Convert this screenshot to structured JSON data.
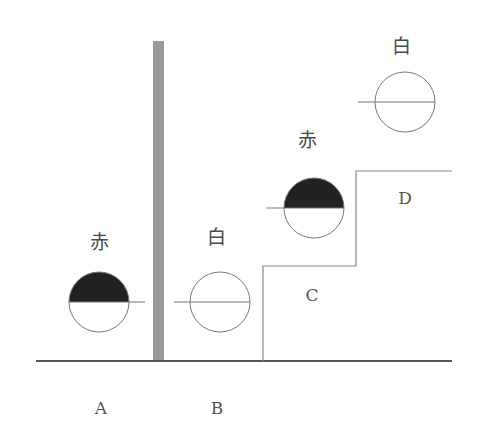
{
  "diagram": {
    "type": "flag-signal-step-diagram",
    "colors": {
      "background": "#ffffff",
      "line": "#777777",
      "ground": "#555555",
      "pole": "#9a9a9a",
      "red_fill": "#222222"
    },
    "flags": [
      {
        "id": "A",
        "label": "赤",
        "meaning": "red",
        "cx": 99,
        "cy": 302,
        "filled_top": true,
        "line_x1": 69,
        "line_x2": 145,
        "label_x": 99,
        "label_y": 240
      },
      {
        "id": "B",
        "label": "白",
        "meaning": "white",
        "cx": 220,
        "cy": 302,
        "filled_top": false,
        "line_x1": 174,
        "line_x2": 250,
        "label_x": 216,
        "label_y": 235
      },
      {
        "id": "C",
        "label": "赤",
        "meaning": "red",
        "cx": 314,
        "cy": 208,
        "filled_top": true,
        "line_x1": 266,
        "line_x2": 344,
        "label_x": 307,
        "label_y": 138
      },
      {
        "id": "D",
        "label": "白",
        "meaning": "white",
        "cx": 405,
        "cy": 102,
        "filled_top": false,
        "line_x1": 358,
        "line_x2": 435,
        "label_x": 401,
        "label_y": 44
      }
    ],
    "regions": [
      {
        "label": "A",
        "x": 101,
        "y": 408
      },
      {
        "label": "B",
        "x": 217,
        "y": 408
      },
      {
        "label": "C",
        "x": 312,
        "y": 295
      },
      {
        "label": "D",
        "x": 405,
        "y": 198
      }
    ],
    "radius": 30
  }
}
